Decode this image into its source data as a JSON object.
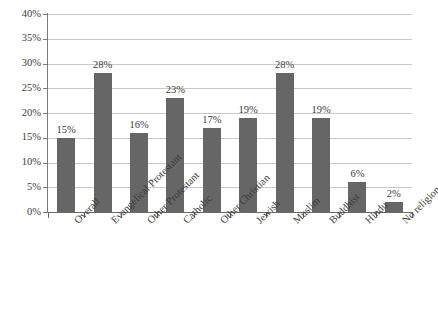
{
  "chart_data": {
    "type": "bar",
    "title": "",
    "subtitle": "",
    "xlabel": "",
    "ylabel": "",
    "categories": [
      "Overall",
      "Evangelical Protestant",
      "Other Protestant",
      "Catholic",
      "Other Christian",
      "Jewish",
      "Muslim",
      "Buddhist",
      "Hindu",
      "No religion"
    ],
    "values": [
      15,
      28,
      16,
      23,
      17,
      19,
      28,
      19,
      6,
      2
    ],
    "data_labels": [
      "15%",
      "28%",
      "16%",
      "23%",
      "17%",
      "19%",
      "28%",
      "19%",
      "6%",
      "2%"
    ],
    "ylim": [
      0,
      40
    ],
    "ytick_values": [
      0,
      5,
      10,
      15,
      20,
      25,
      30,
      35,
      40
    ],
    "ytick_labels": [
      "0%",
      "5%",
      "10%",
      "15%",
      "20%",
      "25%",
      "30%",
      "35%",
      "40%"
    ],
    "ytick_step": 5,
    "grid": true,
    "grid_axis": "y",
    "legend": false,
    "legend_position": "none",
    "bar_color": "#666666",
    "grid_color": "#c9c9c9",
    "axis_color": "#6a6a6a",
    "text_color": "#3b3b3b",
    "background": "#ffffff",
    "xtick_label_rotation": -45
  }
}
